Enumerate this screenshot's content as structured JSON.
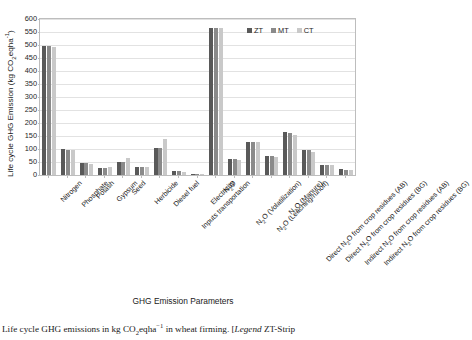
{
  "chart_data": {
    "type": "bar",
    "title": "",
    "xlabel": "GHG Emission Parameters",
    "ylabel": "Life cycle GHG Emission (kg CO2eqha-1)",
    "ylim": [
      0,
      600
    ],
    "yticks": [
      0,
      50,
      100,
      150,
      200,
      250,
      300,
      350,
      400,
      450,
      500,
      550,
      600
    ],
    "grid": true,
    "legend_position": "top-right",
    "categories": [
      "Nitrogen",
      "Phosphate",
      "Potash",
      "Gypsum",
      "Seed",
      "Herbicide",
      "Diesel fuel",
      "Inputs transportation",
      "Electricity",
      "N2O",
      "N2O (Volatilization)",
      "N2O (Leaching/runoff)",
      "N2O (Manure)",
      "Direct N2O from crop residues (AB)",
      "Direct N2O from crop residues (BG)",
      "Indirect N2O from crop residues (AB)",
      "Indirect N2O from crop residues (BG)"
    ],
    "series": [
      {
        "name": "ZT",
        "values": [
          495,
          100,
          45,
          28,
          50,
          30,
          105,
          17,
          5,
          565,
          60,
          128,
          72,
          165,
          96,
          40,
          22
        ]
      },
      {
        "name": "MT",
        "values": [
          495,
          98,
          45,
          27,
          50,
          30,
          105,
          15,
          5,
          565,
          60,
          128,
          72,
          163,
          95,
          39,
          21
        ]
      },
      {
        "name": "CT",
        "values": [
          493,
          97,
          44,
          30,
          65,
          29,
          140,
          13,
          4,
          565,
          58,
          126,
          70,
          155,
          90,
          38,
          20
        ]
      }
    ]
  },
  "legend": {
    "items": [
      {
        "key": "zt",
        "label": "ZT",
        "color": "#595959"
      },
      {
        "key": "mt",
        "label": "MT",
        "color": "#8a8a8a"
      },
      {
        "key": "ct",
        "label": "CT",
        "color": "#c9c9c9"
      }
    ]
  },
  "axis": {
    "y_title_prefix": "Life cycle GHG Emission (kg CO",
    "y_title_sub": "2",
    "y_title_mid": "eqha",
    "y_title_sup": "-1",
    "y_title_suffix": ")",
    "x_title": "GHG Emission Parameters"
  },
  "caption": {
    "part1": "Life cycle GHG emissions in kg CO",
    "sub": "2",
    "part2": "eqha",
    "sup": "−1",
    "part3": " in wheat firming. [",
    "legend_word": "Legend",
    "part4": " ZT-Strip"
  }
}
